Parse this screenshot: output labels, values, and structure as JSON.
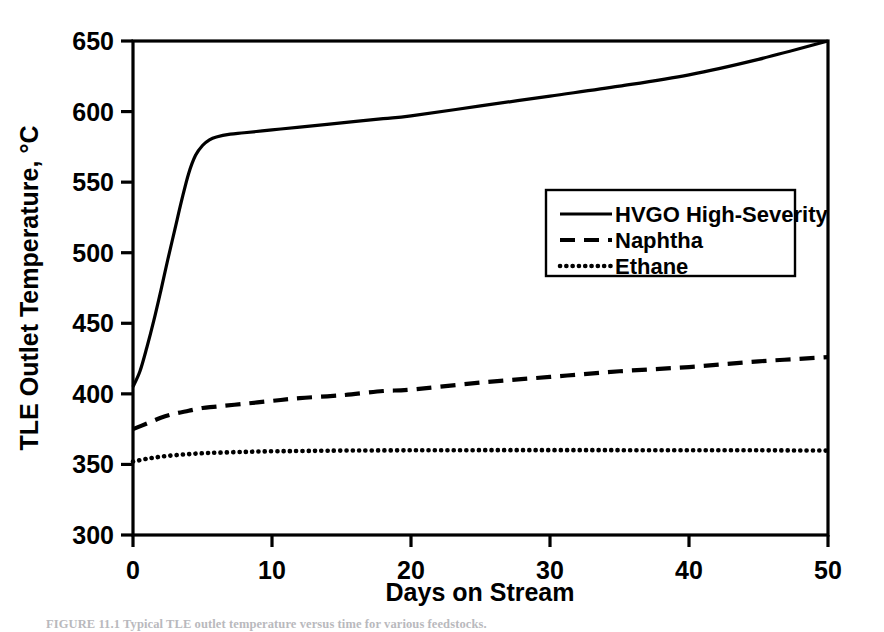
{
  "figure": {
    "caption": "FIGURE 11.1  Typical TLE outlet temperature versus time for various feedstocks."
  },
  "chart_data": {
    "type": "line",
    "title": "",
    "xlabel": "Days on Stream",
    "ylabel": "TLE Outlet Temperature, °C",
    "xlim": [
      0,
      50
    ],
    "ylim": [
      300,
      650
    ],
    "xticks": [
      0,
      10,
      20,
      30,
      40,
      50
    ],
    "yticks": [
      300,
      350,
      400,
      450,
      500,
      550,
      600,
      650
    ],
    "xtick_labels": [
      "0",
      "10",
      "20",
      "30",
      "40",
      "50"
    ],
    "ytick_labels": [
      "300",
      "350",
      "400",
      "450",
      "500",
      "550",
      "600",
      "650"
    ],
    "grid": false,
    "legend_position": "center-right",
    "series": [
      {
        "name": "HVGO High-Severity",
        "style": "solid",
        "color": "#000000",
        "x": [
          0,
          0.5,
          1,
          1.5,
          2,
          2.5,
          3,
          3.5,
          4,
          4.5,
          5,
          5.5,
          6,
          7,
          8,
          10,
          12,
          15,
          18,
          20,
          25,
          30,
          35,
          40,
          45,
          50
        ],
        "y": [
          405,
          416,
          433,
          452,
          473,
          495,
          516,
          537,
          556,
          569,
          576,
          580,
          582,
          584,
          585,
          587,
          589,
          592,
          595,
          597,
          604,
          611,
          618,
          626,
          637,
          650
        ]
      },
      {
        "name": "Naphtha",
        "style": "dashed",
        "color": "#000000",
        "x": [
          0,
          1,
          2,
          3,
          4,
          5,
          6,
          8,
          10,
          12,
          15,
          18,
          20,
          25,
          30,
          35,
          40,
          45,
          50
        ],
        "y": [
          375,
          379,
          383,
          386,
          388,
          390,
          391,
          393,
          395,
          397,
          399,
          402,
          403,
          408,
          412,
          416,
          419,
          423,
          426
        ]
      },
      {
        "name": "Ethane",
        "style": "dotted",
        "color": "#000000",
        "x": [
          0,
          1,
          2,
          3,
          4,
          5,
          6,
          8,
          10,
          12,
          15,
          20,
          25,
          30,
          35,
          40,
          45,
          50
        ],
        "y": [
          352,
          354,
          355.5,
          356.5,
          357.3,
          357.9,
          358.3,
          358.9,
          359.3,
          359.5,
          359.8,
          360,
          360.1,
          360.1,
          360.1,
          360,
          360,
          359.8
        ]
      }
    ]
  }
}
